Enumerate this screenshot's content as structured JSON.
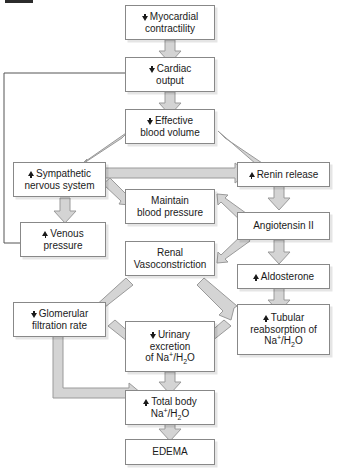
{
  "diagram": {
    "nodes": [
      {
        "id": "myocardial_contractility",
        "change": "down",
        "line1": "Myocardial",
        "line2": "contractility"
      },
      {
        "id": "cardiac_output",
        "change": "down",
        "line1": "Cardiac",
        "line2": "output"
      },
      {
        "id": "effective_blood_volume",
        "change": "down",
        "line1": "Effective",
        "line2": "blood volume"
      },
      {
        "id": "sympathetic_nervous_system",
        "change": "up",
        "line1": "Sympathetic",
        "line2": "nervous system"
      },
      {
        "id": "renin_release",
        "change": "up",
        "line1": "Renin release",
        "line2": ""
      },
      {
        "id": "maintain_blood_pressure",
        "change": "none",
        "line1": "Maintain",
        "line2": "blood pressure"
      },
      {
        "id": "venous_pressure",
        "change": "up",
        "line1": "Venous",
        "line2": "pressure"
      },
      {
        "id": "angiotensin_ii",
        "change": "none",
        "line1": "Angiotensin II",
        "line2": ""
      },
      {
        "id": "renal_vasoconstriction",
        "change": "none",
        "line1": "Renal",
        "line2": "Vasoconstriction"
      },
      {
        "id": "aldosterone",
        "change": "up",
        "line1": "Aldosterone",
        "line2": ""
      },
      {
        "id": "glomerular_filtration_rate",
        "change": "down",
        "line1": "Glomerular",
        "line2": "filtration rate"
      },
      {
        "id": "urinary_excretion",
        "change": "down",
        "line1": "Urinary",
        "line2": "excretion",
        "line3": "of Na+/H2O"
      },
      {
        "id": "tubular_reabsorption",
        "change": "up",
        "line1": "Tubular",
        "line2": "reabsorption of",
        "line3": "Na+/H2O"
      },
      {
        "id": "total_body",
        "change": "up",
        "line1": "Total body",
        "line2": "Na+/H2O"
      },
      {
        "id": "edema",
        "change": "none",
        "line1": "EDEMA",
        "line2": ""
      }
    ],
    "labels": {
      "myocardial_contractility_l1": "Myocardial",
      "myocardial_contractility_l2": "contractility",
      "cardiac_output_l1": "Cardiac",
      "cardiac_output_l2": "output",
      "effective_blood_volume_l1": "Effective",
      "effective_blood_volume_l2": "blood volume",
      "sympathetic_l1": "Sympathetic",
      "sympathetic_l2": "nervous system",
      "renin_release": "Renin release",
      "maintain_bp_l1": "Maintain",
      "maintain_bp_l2": "blood pressure",
      "venous_pressure_l1": "Venous",
      "venous_pressure_l2": "pressure",
      "angiotensin_ii": "Angiotensin II",
      "renal_vaso_l1": "Renal",
      "renal_vaso_l2": "Vasoconstriction",
      "aldosterone": "Aldosterone",
      "gfr_l1": "Glomerular",
      "gfr_l2": "filtration rate",
      "urinary_l1": "Urinary",
      "urinary_l2": "excretion",
      "urinary_l3_pre": "of Na",
      "urinary_l3_sup": "+",
      "urinary_l3_mid": "/H",
      "urinary_l3_sub": "2",
      "urinary_l3_post": "O",
      "tubular_l1": "Tubular",
      "tubular_l2": "reabsorption of",
      "tubular_l3_pre": "Na",
      "tubular_l3_sup": "+",
      "tubular_l3_mid": "/H",
      "tubular_l3_sub": "2",
      "tubular_l3_post": "O",
      "total_body_l1": "Total body",
      "total_body_l2_pre": "Na",
      "total_body_l2_sup": "+",
      "total_body_l2_mid": "/H",
      "total_body_l2_sub": "2",
      "total_body_l2_post": "O",
      "edema": "EDEMA"
    },
    "edges": [
      {
        "from": "myocardial_contractility",
        "to": "cardiac_output",
        "style": "block"
      },
      {
        "from": "cardiac_output",
        "to": "effective_blood_volume",
        "style": "block"
      },
      {
        "from": "effective_blood_volume",
        "to": "sympathetic_nervous_system",
        "style": "block"
      },
      {
        "from": "effective_blood_volume",
        "to": "renin_release",
        "style": "block"
      },
      {
        "from": "sympathetic_nervous_system",
        "to": "renin_release",
        "style": "block"
      },
      {
        "from": "sympathetic_nervous_system",
        "to": "maintain_blood_pressure",
        "style": "block"
      },
      {
        "from": "sympathetic_nervous_system",
        "to": "venous_pressure",
        "style": "block"
      },
      {
        "from": "renin_release",
        "to": "angiotensin_ii",
        "style": "block"
      },
      {
        "from": "angiotensin_ii",
        "to": "maintain_blood_pressure",
        "style": "block"
      },
      {
        "from": "angiotensin_ii",
        "to": "renal_vasoconstriction",
        "style": "block"
      },
      {
        "from": "angiotensin_ii",
        "to": "aldosterone",
        "style": "block"
      },
      {
        "from": "renal_vasoconstriction",
        "to": "glomerular_filtration_rate",
        "style": "block"
      },
      {
        "from": "renal_vasoconstriction",
        "to": "tubular_reabsorption",
        "style": "block"
      },
      {
        "from": "aldosterone",
        "to": "tubular_reabsorption",
        "style": "block"
      },
      {
        "from": "glomerular_filtration_rate",
        "to": "urinary_excretion",
        "style": "block"
      },
      {
        "from": "tubular_reabsorption",
        "to": "urinary_excretion",
        "style": "block"
      },
      {
        "from": "urinary_excretion",
        "to": "total_body",
        "style": "block"
      },
      {
        "from": "glomerular_filtration_rate",
        "to": "total_body",
        "style": "block-elbow"
      },
      {
        "from": "total_body",
        "to": "edema",
        "style": "block"
      },
      {
        "from": "cardiac_output",
        "to": "venous_pressure",
        "style": "thin-feedback"
      }
    ],
    "colors": {
      "arrow_fill": "#d4d4d4",
      "arrow_stroke": "#9a9a9a",
      "box_border": "#888888",
      "box_fill": "#ffffff",
      "text": "#1a1a1a",
      "thin_line": "#555555"
    }
  }
}
